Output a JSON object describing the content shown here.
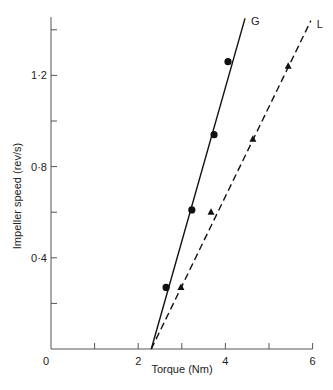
{
  "chart_data": {
    "type": "scatter",
    "title": "",
    "xlabel": "Torque (Nm)",
    "ylabel": "Impeller speed (rev/s)",
    "xlim": [
      0,
      6
    ],
    "ylim": [
      0,
      1.45
    ],
    "x_ticks": [
      0,
      1,
      2,
      3,
      4,
      5,
      6
    ],
    "x_tick_labels": [
      "0",
      "",
      "2",
      "",
      "4",
      "",
      "6"
    ],
    "y_ticks": [
      0,
      0.2,
      0.4,
      0.6,
      0.8,
      1.0,
      1.2,
      1.4
    ],
    "y_tick_labels": [
      "0",
      "",
      "0·4",
      "",
      "0·8",
      "",
      "1·2",
      ""
    ],
    "grid": false,
    "legend": "inline labels at line ends",
    "series": [
      {
        "name": "G",
        "marker": "circle",
        "line_style": "solid",
        "points": [
          [
            2.64,
            0.27
          ],
          [
            3.23,
            0.61
          ],
          [
            3.74,
            0.94
          ],
          [
            4.06,
            1.26
          ]
        ],
        "fit_line": [
          [
            2.3,
            0.0
          ],
          [
            4.45,
            1.45
          ]
        ]
      },
      {
        "name": "L",
        "marker": "triangle",
        "line_style": "dashed",
        "points": [
          [
            2.98,
            0.27
          ],
          [
            3.67,
            0.6
          ],
          [
            4.63,
            0.92
          ],
          [
            5.44,
            1.24
          ]
        ],
        "fit_line": [
          [
            2.3,
            0.0
          ],
          [
            5.96,
            1.44
          ]
        ]
      }
    ]
  }
}
